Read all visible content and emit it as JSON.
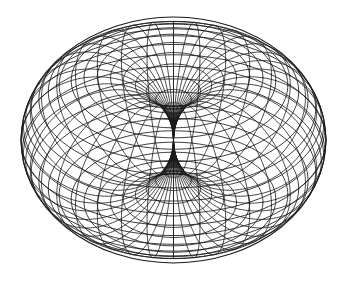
{
  "figure": {
    "title": "",
    "background_color": "#ffffff",
    "line_color": "#1a1a1a",
    "caption": ""
  },
  "chart_data": {
    "type": "surface-wireframe",
    "surface_name": "horn torus",
    "title": "",
    "subtitle": "",
    "xlabel": "",
    "ylabel": "",
    "zlabel": "",
    "legend": [],
    "annotations": [],
    "grid": false,
    "axes_visible": false,
    "tick_labels": [],
    "parametric": {
      "equations": {
        "x": "(R + r*cos(v)) * cos(u)",
        "y": "(R + r*cos(v)) * sin(u)",
        "z": "r * sin(v)"
      },
      "R": 1.0,
      "r": 1.0,
      "u_range": [
        0,
        6.283185307179586
      ],
      "v_range": [
        0,
        6.283185307179586
      ],
      "u_steps": 36,
      "v_steps": 36
    },
    "projection": {
      "type": "orthographic",
      "elevation_deg": 34,
      "azimuth_deg": 0,
      "roll_deg": 0
    },
    "view": {
      "center_px": [
        173.5,
        140.0
      ],
      "scale_x_px": 76.2,
      "scale_y_px": 76.2,
      "bbox_px": [
        21,
        17,
        326,
        263
      ]
    },
    "pinch_point_px": [
      173.5,
      140.0
    ],
    "silhouette": {
      "outer_ellipse_center_px": [
        173.5,
        140.0
      ],
      "outer_semi_major_px": 152.5,
      "outer_semi_minor_px": 123.0
    }
  }
}
